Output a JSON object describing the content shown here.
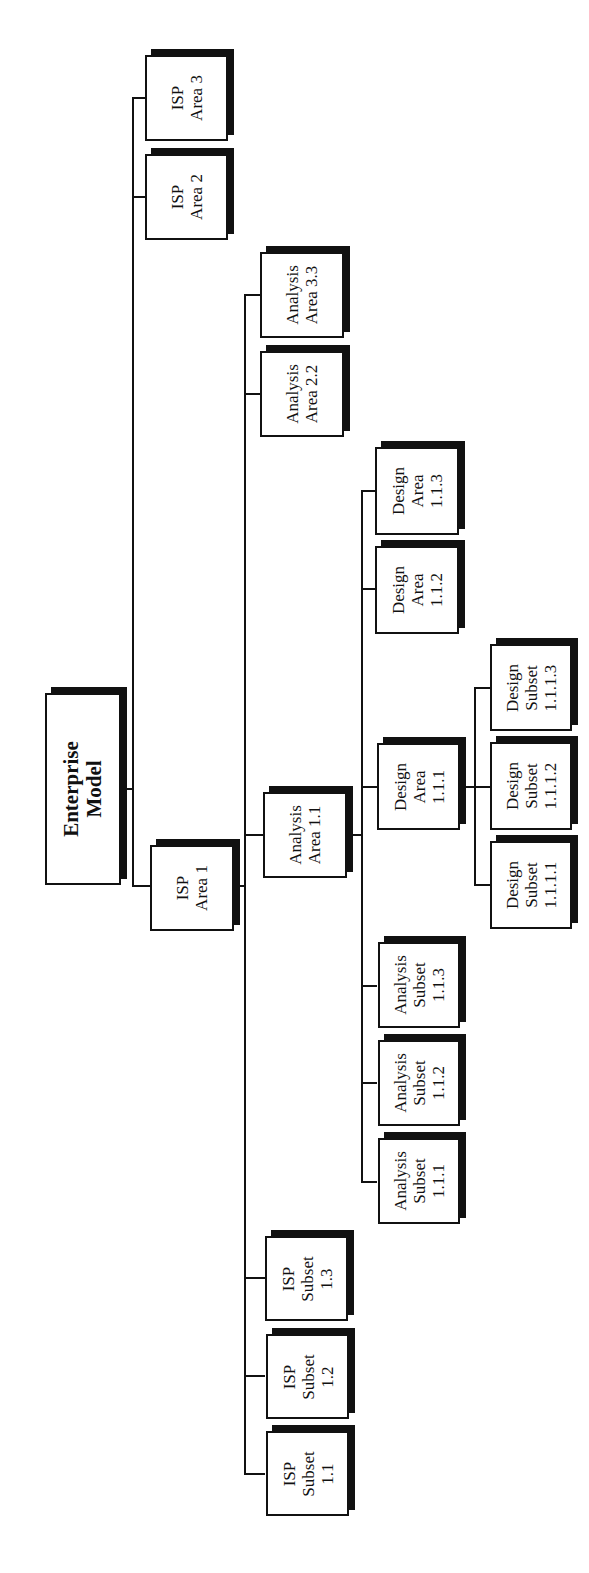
{
  "diagram": {
    "type": "hierarchy-chart",
    "orientation": "rotated-90-ccw",
    "root": {
      "id": "enterprise-model",
      "lines": [
        "Enterprise",
        "Model"
      ]
    },
    "nodes": {
      "isp_area_3": {
        "lines": [
          "ISP",
          "Area 3"
        ]
      },
      "isp_area_2": {
        "lines": [
          "ISP",
          "Area 2"
        ]
      },
      "isp_area_1": {
        "lines": [
          "ISP",
          "Area 1"
        ]
      },
      "analysis_area_3_3": {
        "lines": [
          "Analysis",
          "Area 3.3"
        ]
      },
      "analysis_area_2_2": {
        "lines": [
          "Analysis",
          "Area 2.2"
        ]
      },
      "analysis_area_1_1": {
        "lines": [
          "Analysis",
          "Area 1.1"
        ]
      },
      "design_area_1_1_3": {
        "lines": [
          "Design",
          "Area",
          "1.1.3"
        ]
      },
      "design_area_1_1_2": {
        "lines": [
          "Design",
          "Area",
          "1.1.2"
        ]
      },
      "design_area_1_1_1": {
        "lines": [
          "Design",
          "Area",
          "1.1.1"
        ]
      },
      "design_subset_1_1_1_3": {
        "lines": [
          "Design",
          "Subset",
          "1.1.1.3"
        ]
      },
      "design_subset_1_1_1_2": {
        "lines": [
          "Design",
          "Subset",
          "1.1.1.2"
        ]
      },
      "design_subset_1_1_1_1": {
        "lines": [
          "Design",
          "Subset",
          "1.1.1.1"
        ]
      },
      "analysis_subset_1_1_3": {
        "lines": [
          "Analysis",
          "Subset",
          "1.1.3"
        ]
      },
      "analysis_subset_1_1_2": {
        "lines": [
          "Analysis",
          "Subset",
          "1.1.2"
        ]
      },
      "analysis_subset_1_1_1": {
        "lines": [
          "Analysis",
          "Subset",
          "1.1.1"
        ]
      },
      "isp_subset_1_3": {
        "lines": [
          "ISP",
          "Subset",
          "1.3"
        ]
      },
      "isp_subset_1_2": {
        "lines": [
          "ISP",
          "Subset",
          "1.2"
        ]
      },
      "isp_subset_1_1": {
        "lines": [
          "ISP",
          "Subset",
          "1.1"
        ]
      }
    },
    "edges": [
      [
        "Enterprise Model",
        "ISP Area 1"
      ],
      [
        "Enterprise Model",
        "ISP Area 2"
      ],
      [
        "Enterprise Model",
        "ISP Area 3"
      ],
      [
        "ISP Area 1",
        "Analysis Area 1.1"
      ],
      [
        "ISP Area 1",
        "Analysis Area 2.2"
      ],
      [
        "ISP Area 1",
        "Analysis Area 3.3"
      ],
      [
        "ISP Area 1",
        "ISP Subset 1.1"
      ],
      [
        "ISP Area 1",
        "ISP Subset 1.2"
      ],
      [
        "ISP Area 1",
        "ISP Subset 1.3"
      ],
      [
        "Analysis Area 1.1",
        "Design Area 1.1.1"
      ],
      [
        "Analysis Area 1.1",
        "Design Area 1.1.2"
      ],
      [
        "Analysis Area 1.1",
        "Design Area 1.1.3"
      ],
      [
        "Analysis Area 1.1",
        "Analysis Subset 1.1.1"
      ],
      [
        "Analysis Area 1.1",
        "Analysis Subset 1.1.2"
      ],
      [
        "Analysis Area 1.1",
        "Analysis Subset 1.1.3"
      ],
      [
        "Design Area 1.1.1",
        "Design Subset 1.1.1.1"
      ],
      [
        "Design Area 1.1.1",
        "Design Subset 1.1.1.2"
      ],
      [
        "Design Area 1.1.1",
        "Design Subset 1.1.1.3"
      ]
    ],
    "colors": {
      "line": "#111111",
      "box_fill": "#ffffff",
      "shadow": "#111111",
      "background": "#ffffff"
    }
  }
}
